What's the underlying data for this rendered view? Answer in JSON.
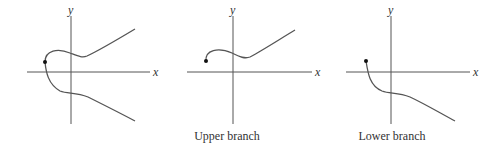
{
  "panels": [
    {
      "id": "full-curve",
      "x_label": "x",
      "y_label": "y",
      "caption": ""
    },
    {
      "id": "upper-branch",
      "x_label": "x",
      "y_label": "y",
      "caption": "Upper branch"
    },
    {
      "id": "lower-branch",
      "x_label": "x",
      "y_label": "y",
      "caption": "Lower branch"
    }
  ],
  "colors": {
    "stroke": "#555555",
    "dot": "#111111",
    "text": "#333333"
  }
}
